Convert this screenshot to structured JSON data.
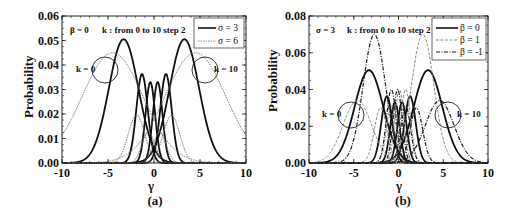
{
  "chart_data": [
    {
      "type": "line",
      "panel_label": "(a)",
      "xlabel": "γ",
      "ylabel": "Probability",
      "xlim": [
        -10,
        10
      ],
      "ylim": [
        0,
        0.06
      ],
      "xticks": [
        "-10",
        "-5",
        "0",
        "5",
        "10"
      ],
      "yticks": [
        "0.00",
        "0.01",
        "0.02",
        "0.03",
        "0.04",
        "0.05",
        "0.06"
      ],
      "grid": false,
      "legend_position": "upper right",
      "annotations": [
        "β = 0",
        "k : from 0  to 10 step 2",
        "k = 0",
        "k = 10"
      ],
      "series": [
        {
          "name": "σ = 3",
          "style": "solid",
          "color": "#111111",
          "width": 1.8,
          "peaks": [
            {
              "k": 0,
              "mu": -3.3,
              "amp": 0.0505,
              "sd": 1.6
            },
            {
              "k": 2,
              "mu": -1.3,
              "amp": 0.0363,
              "sd": 0.62
            },
            {
              "k": 4,
              "mu": -0.4,
              "amp": 0.033,
              "sd": 0.52
            },
            {
              "k": 6,
              "mu": 0.4,
              "amp": 0.033,
              "sd": 0.52
            },
            {
              "k": 8,
              "mu": 1.3,
              "amp": 0.0363,
              "sd": 0.62
            },
            {
              "k": 10,
              "mu": 3.3,
              "amp": 0.0505,
              "sd": 1.6
            }
          ]
        },
        {
          "name": "σ = 6",
          "style": "dotted",
          "color": "#777777",
          "width": 1.0,
          "peaks": [
            {
              "k": 0,
              "mu": -4.5,
              "amp": 0.045,
              "sd": 3.3
            },
            {
              "k": 2,
              "mu": -1.9,
              "amp": 0.0195,
              "sd": 0.9
            },
            {
              "k": 4,
              "mu": -0.6,
              "amp": 0.0125,
              "sd": 0.7
            },
            {
              "k": 6,
              "mu": 0.6,
              "amp": 0.0125,
              "sd": 0.7
            },
            {
              "k": 8,
              "mu": 1.9,
              "amp": 0.0195,
              "sd": 0.9
            },
            {
              "k": 10,
              "mu": 4.5,
              "amp": 0.045,
              "sd": 3.3
            }
          ]
        }
      ]
    },
    {
      "type": "line",
      "panel_label": "(b)",
      "xlabel": "γ",
      "ylabel": "Probability",
      "xlim": [
        -10,
        10
      ],
      "ylim": [
        0,
        0.08
      ],
      "xticks": [
        "-10",
        "-5",
        "0",
        "5",
        "10"
      ],
      "yticks": [
        "0.00",
        "0.02",
        "0.04",
        "0.06",
        "0.08"
      ],
      "grid": false,
      "legend_position": "upper right",
      "annotations": [
        "σ = 3",
        "k : from 0  to 10 step 2",
        "k = 0",
        "k = 10"
      ],
      "series": [
        {
          "name": "β = 0",
          "style": "solid",
          "color": "#111111",
          "width": 1.8,
          "peaks": [
            {
              "k": 0,
              "mu": -3.3,
              "amp": 0.0505,
              "sd": 1.6
            },
            {
              "k": 2,
              "mu": -1.3,
              "amp": 0.0363,
              "sd": 0.62
            },
            {
              "k": 4,
              "mu": -0.4,
              "amp": 0.033,
              "sd": 0.52
            },
            {
              "k": 6,
              "mu": 0.4,
              "amp": 0.033,
              "sd": 0.52
            },
            {
              "k": 8,
              "mu": 1.3,
              "amp": 0.0363,
              "sd": 0.62
            },
            {
              "k": 10,
              "mu": 3.3,
              "amp": 0.0505,
              "sd": 1.6
            }
          ]
        },
        {
          "name": "β = 1",
          "style": "dashed",
          "color": "#888888",
          "width": 1.0,
          "peaks": [
            {
              "k": 0,
              "mu": -4.6,
              "amp": 0.034,
              "sd": 1.6
            },
            {
              "k": 2,
              "mu": -2.0,
              "amp": 0.03,
              "sd": 0.7
            },
            {
              "k": 4,
              "mu": -0.8,
              "amp": 0.031,
              "sd": 0.55
            },
            {
              "k": 6,
              "mu": 0.1,
              "amp": 0.04,
              "sd": 0.5
            },
            {
              "k": 8,
              "mu": 0.8,
              "amp": 0.04,
              "sd": 0.55
            },
            {
              "k": 10,
              "mu": 2.7,
              "amp": 0.07,
              "sd": 1.25
            }
          ]
        },
        {
          "name": "β = -1",
          "style": "dashdot",
          "color": "#222222",
          "width": 1.2,
          "peaks": [
            {
              "k": 0,
              "mu": -2.7,
              "amp": 0.07,
              "sd": 1.25
            },
            {
              "k": 2,
              "mu": -0.8,
              "amp": 0.04,
              "sd": 0.55
            },
            {
              "k": 4,
              "mu": -0.1,
              "amp": 0.04,
              "sd": 0.5
            },
            {
              "k": 6,
              "mu": 0.8,
              "amp": 0.031,
              "sd": 0.55
            },
            {
              "k": 8,
              "mu": 2.0,
              "amp": 0.03,
              "sd": 0.7
            },
            {
              "k": 10,
              "mu": 4.6,
              "amp": 0.034,
              "sd": 1.6
            }
          ]
        }
      ]
    }
  ],
  "panels": {
    "a": {
      "label": "(a)",
      "xlabel": "γ",
      "ylabel": "Probability",
      "param_text": "β = 0",
      "k_text": "k : from 0  to 10 step 2",
      "k0_text": "k = 0",
      "k10_text": "k = 10",
      "legend": [
        "σ = 3",
        "σ = 6"
      ],
      "yticks": [
        "0.00",
        "0.01",
        "0.02",
        "0.03",
        "0.04",
        "0.05",
        "0.06"
      ],
      "xticks": [
        "-10",
        "-5",
        "0",
        "5",
        "10"
      ]
    },
    "b": {
      "label": "(b)",
      "xlabel": "γ",
      "ylabel": "Probability",
      "param_text": "σ = 3",
      "k_text": "k : from 0  to 10 step 2",
      "k0_text": "k = 0",
      "k10_text": "k = 10",
      "legend": [
        "β = 0",
        "β = 1",
        "β = -1"
      ],
      "yticks": [
        "0.00",
        "0.02",
        "0.04",
        "0.06",
        "0.08"
      ],
      "xticks": [
        "-10",
        "-5",
        "0",
        "5",
        "10"
      ]
    }
  }
}
